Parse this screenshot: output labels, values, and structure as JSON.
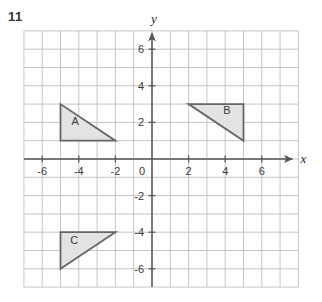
{
  "question_number": "11",
  "chart_data": {
    "type": "scatter",
    "title": "",
    "xlabel": "x",
    "ylabel": "y",
    "xlim": [
      -7,
      8
    ],
    "ylim": [
      -7,
      7
    ],
    "grid": true,
    "grid_step": 1,
    "legend": "none",
    "x_tick_labels": [
      "-6",
      "-4",
      "-2",
      "0",
      "2",
      "4",
      "6"
    ],
    "x_tick_values": [
      -6,
      -4,
      -2,
      0,
      2,
      4,
      6
    ],
    "y_tick_labels": [
      "6",
      "4",
      "2",
      "0",
      "-2",
      "-4",
      "-6"
    ],
    "y_tick_values": [
      6,
      4,
      2,
      0,
      -2,
      -4,
      -6
    ],
    "origin_label": "0",
    "shapes": [
      {
        "label": "A",
        "kind": "triangle",
        "vertices": [
          [
            -5,
            3
          ],
          [
            -5,
            1
          ],
          [
            -2,
            1
          ]
        ],
        "label_position": [
          -4.2,
          1.85
        ],
        "fill": "#e3e3e3",
        "stroke": "#666666"
      },
      {
        "label": "B",
        "kind": "triangle",
        "vertices": [
          [
            2,
            3
          ],
          [
            5,
            3
          ],
          [
            5,
            1
          ]
        ],
        "label_position": [
          4.1,
          2.45
        ],
        "fill": "#e3e3e3",
        "stroke": "#666666"
      },
      {
        "label": "C",
        "kind": "triangle",
        "vertices": [
          [
            -5,
            -4
          ],
          [
            -2,
            -4
          ],
          [
            -5,
            -6
          ]
        ],
        "label_position": [
          -4.25,
          -4.65
        ],
        "fill": "#e3e3e3",
        "stroke": "#666666"
      }
    ],
    "colors": {
      "grid_line": "#c0c0c0",
      "axis_line": "#555555",
      "shape_fill": "#e3e3e3",
      "shape_stroke": "#666666",
      "background": "#ffffff",
      "text": "#3a3a3a"
    }
  }
}
